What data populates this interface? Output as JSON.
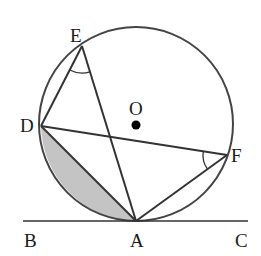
{
  "diagram": {
    "type": "circle-geometry",
    "circle": {
      "center_label": "O",
      "cx": 136,
      "cy": 124,
      "r": 97
    },
    "points": {
      "A": {
        "label": "A",
        "x": 136,
        "y": 221
      },
      "B": {
        "label": "B",
        "x": 23,
        "y": 221
      },
      "C": {
        "label": "C",
        "x": 248,
        "y": 221
      },
      "D": {
        "label": "D",
        "x": 41,
        "y": 126
      },
      "E": {
        "label": "E",
        "x": 82,
        "y": 46
      },
      "F": {
        "label": "F",
        "x": 227,
        "y": 155
      },
      "O": {
        "label": "O",
        "x": 136,
        "y": 124
      }
    },
    "segments": [
      "BC (tangent at A)",
      "DE",
      "EA",
      "DF",
      "FA",
      "DA"
    ],
    "angle_marks": [
      "angle DEA",
      "angle DFA"
    ],
    "shaded_region": "circular segment between chord DA and minor arc DA",
    "colors": {
      "stroke": "#333333",
      "shade": "#c4c4c4",
      "dot": "#000000"
    }
  }
}
